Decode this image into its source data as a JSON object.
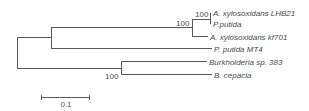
{
  "tree": {
    "taxa": [
      {
        "label": "A. xylosoxidans LHB21"
      },
      {
        "label": "P.putida"
      },
      {
        "label": "A. xylosoxidans kf701"
      },
      {
        "label": "P. putida MT4"
      },
      {
        "label": "Burkholderia sp. 383"
      },
      {
        "label": "B. cepacia"
      }
    ],
    "bootstrap": [
      {
        "value": "100"
      },
      {
        "value": "100"
      },
      {
        "value": "100"
      }
    ],
    "scale_bar": {
      "label": "0.1"
    },
    "colors": {
      "line": "#5a5a5a",
      "text": "#4a4a4a"
    }
  }
}
